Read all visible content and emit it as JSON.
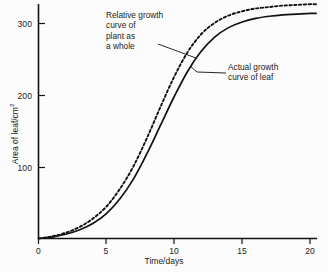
{
  "chart_data": {
    "type": "line",
    "title": "",
    "xlabel": "Time/days",
    "ylabel": "Area of leaf/cm",
    "ylabel_superscript": "2",
    "xlim": [
      0,
      20.5
    ],
    "ylim": [
      0,
      340
    ],
    "xticks": [
      0,
      5,
      10,
      15,
      20
    ],
    "xtick_labels": [
      "0",
      "5",
      "10",
      "15",
      "20"
    ],
    "yticks": [
      100,
      200,
      300
    ],
    "ytick_labels": [
      "100",
      "200",
      "300"
    ],
    "grid": false,
    "legend_position": "none",
    "series": [
      {
        "name": "Relative growth curve of plant as a whole",
        "style": "dotted",
        "color": "#111111",
        "x": [
          0,
          1,
          2,
          3,
          4,
          5,
          6,
          7,
          8,
          9,
          10,
          11,
          12,
          13,
          14,
          15,
          16,
          17,
          18,
          19,
          20,
          20.5
        ],
        "y": [
          0,
          3,
          8,
          16,
          28,
          45,
          70,
          102,
          142,
          186,
          228,
          263,
          288,
          304,
          314,
          320,
          324,
          326,
          328,
          329,
          330,
          330
        ]
      },
      {
        "name": "Actual growth curve of leaf",
        "style": "solid",
        "color": "#111111",
        "x": [
          0,
          1,
          2,
          3,
          4,
          5,
          6,
          7,
          8,
          9,
          10,
          11,
          12,
          13,
          14,
          15,
          16,
          17,
          18,
          19,
          20,
          20.5
        ],
        "y": [
          0,
          2,
          6,
          12,
          21,
          35,
          56,
          84,
          120,
          160,
          200,
          236,
          264,
          284,
          297,
          305,
          310,
          313,
          315,
          316,
          317,
          317
        ]
      }
    ],
    "annotations": [
      {
        "id": "relative-growth",
        "text": "Relative growth\ncurve of\nplant as\na whole",
        "target_series": "Relative growth curve of plant as a whole"
      },
      {
        "id": "actual-growth",
        "text": "Actual growth\ncurve of leaf",
        "target_series": "Actual growth curve of leaf"
      }
    ]
  },
  "colors": {
    "axis": "#111111",
    "curve": "#111111",
    "background": "#fcfcfc",
    "text": "#1b1b1b"
  }
}
